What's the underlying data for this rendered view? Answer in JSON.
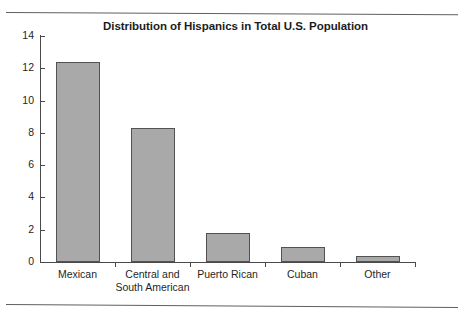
{
  "page": {
    "rule_color": "#5f5f5f"
  },
  "chart_data": {
    "type": "bar",
    "title": "Distribution of Hispanics in Total U.S. Population",
    "xlabel": "",
    "ylabel": "",
    "categories": [
      "Mexican",
      "Central and South American",
      "Puerto Rican",
      "Cuban",
      "Other"
    ],
    "category_lines": [
      [
        "Mexican"
      ],
      [
        "Central and",
        "South American"
      ],
      [
        "Puerto Rican"
      ],
      [
        "Cuban"
      ],
      [
        "Other"
      ]
    ],
    "values": [
      12.4,
      8.3,
      1.8,
      0.9,
      0.4
    ],
    "ylim": [
      0,
      14
    ],
    "ytick_values": [
      0,
      2,
      4,
      6,
      8,
      10,
      12,
      14
    ],
    "ytick_labels": [
      "0",
      "2",
      "4",
      "6",
      "8",
      "10",
      "12",
      "14"
    ],
    "grid": false,
    "legend": false,
    "bar_color": "#a9a9a9",
    "bar_edge_color": "#525252",
    "axis_color": "#4a4a4a"
  }
}
